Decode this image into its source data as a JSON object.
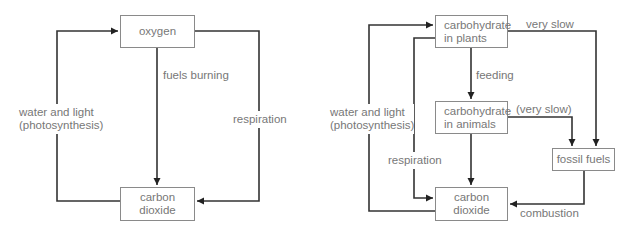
{
  "diagrams": [
    {
      "name": "simple-carbon-oxygen-cycle",
      "nodes": {
        "oxygen": "oxygen",
        "carbon_dioxide_line1": "carbon",
        "carbon_dioxide_line2": "dioxide"
      },
      "edges": {
        "photosynthesis_line1": "water and light",
        "photosynthesis_line2": "(photosynthesis)",
        "fuels_burning": "fuels burning",
        "respiration": "respiration"
      }
    },
    {
      "name": "carbon-cycle",
      "nodes": {
        "plants_line1": "carbohydrate",
        "plants_line2": "in plants",
        "animals_line1": "carbohydrate",
        "animals_line2": "in animals",
        "fossil_fuels": "fossil fuels",
        "carbon_dioxide_line1": "carbon",
        "carbon_dioxide_line2": "dioxide"
      },
      "edges": {
        "photosynthesis_line1": "water and light",
        "photosynthesis_line2": "(photosynthesis)",
        "very_slow": "very slow",
        "feeding": "feeding",
        "very_slow_paren": "(very slow)",
        "respiration": "respiration",
        "combustion": "combustion"
      }
    }
  ]
}
